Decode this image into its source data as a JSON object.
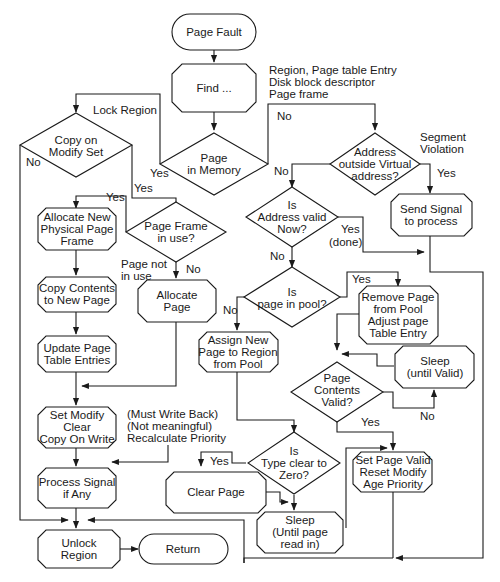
{
  "nodes": {
    "page_fault": {
      "lines": [
        "Page Fault"
      ]
    },
    "find": {
      "lines": [
        "Find ..."
      ]
    },
    "page_in_memory": {
      "lines": [
        "Page",
        "in Memory"
      ]
    },
    "copy_on_modify": {
      "lines": [
        "Copy on",
        "Modify Set"
      ]
    },
    "address_outside": {
      "lines": [
        "Address",
        "outside Virtual",
        "address?"
      ]
    },
    "send_signal": {
      "lines": [
        "Send Signal",
        "to process"
      ]
    },
    "address_valid_now": {
      "lines": [
        "Is",
        "Address valid",
        "Now?"
      ]
    },
    "page_frame_in_use": {
      "lines": [
        "Page Frame",
        "in use?"
      ]
    },
    "allocate_new_frame": {
      "lines": [
        "Allocate New",
        "Physical Page",
        "Frame"
      ]
    },
    "copy_contents": {
      "lines": [
        "Copy Contents",
        "to New Page"
      ]
    },
    "update_page_table": {
      "lines": [
        "Update Page",
        "Table Entries"
      ]
    },
    "allocate_page": {
      "lines": [
        "Allocate",
        "Page"
      ]
    },
    "page_in_pool": {
      "lines": [
        "Is",
        "page in pool?"
      ]
    },
    "remove_page_from_pool": {
      "lines": [
        "Remove Page",
        "from Pool",
        "Adjust page",
        "Table Entry"
      ]
    },
    "assign_new_page": {
      "lines": [
        "Assign New",
        "Page to Region",
        "from Pool"
      ]
    },
    "sleep_until_valid": {
      "lines": [
        "Sleep",
        "(until Valid)"
      ]
    },
    "page_contents_valid": {
      "lines": [
        "Page",
        "Contents",
        "Valid?"
      ]
    },
    "set_modify": {
      "lines": [
        "Set Modify",
        "Clear",
        "Copy On Write"
      ]
    },
    "type_clear_zero": {
      "lines": [
        "Is",
        "Type clear to",
        "Zero?"
      ]
    },
    "set_page_valid": {
      "lines": [
        "Set Page Valid",
        "Reset Modify",
        "Age Priority"
      ]
    },
    "process_signal": {
      "lines": [
        "Process Signal",
        "if Any"
      ]
    },
    "clear_page": {
      "lines": [
        "Clear Page"
      ]
    },
    "sleep_until_read": {
      "lines": [
        "Sleep",
        "(Until page",
        "read in)"
      ]
    },
    "unlock_region": {
      "lines": [
        "Unlock",
        "Region"
      ]
    },
    "return": {
      "lines": [
        "Return"
      ]
    }
  },
  "annotations": {
    "find_outputs": [
      "Region, Page table Entry",
      "Disk block descriptor",
      "Page frame"
    ],
    "lock_region": [
      "Lock Region"
    ],
    "segment_violation": [
      "Segment",
      "Violation"
    ],
    "must_write_back": [
      "(Must Write Back)",
      "(Not meaningful)",
      "Recalculate Priority"
    ],
    "page_not_in_use": [
      "Page not",
      "in use"
    ]
  },
  "edge_labels": {
    "mem_yes": "Yes",
    "mem_no": "No",
    "com_no": "No",
    "com_yes": "Yes",
    "pf_yes": "Yes",
    "pf_no": "No",
    "addr_no": "No",
    "addr_yes": "Yes",
    "valid_yes": "Yes",
    "valid_done": "(done)",
    "valid_no": "No",
    "pool_yes": "Yes",
    "pool_no": "No",
    "contents_no": "No",
    "contents_yes": "Yes",
    "zero_yes": "Yes"
  }
}
